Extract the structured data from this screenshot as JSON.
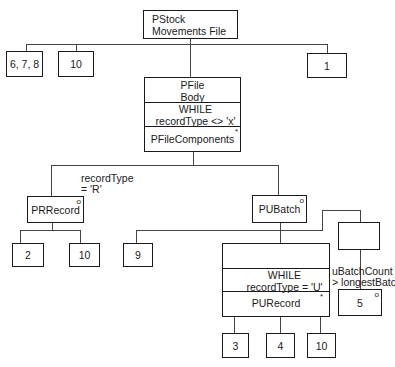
{
  "diagram": {
    "root": {
      "line1": "PStock",
      "line2": "Movements File"
    },
    "level1": [
      {
        "label": "6, 7, 8"
      },
      {
        "label": "10"
      },
      {
        "label": "1"
      }
    ],
    "file_body": {
      "title_line1": "PFile",
      "title_line2": "Body",
      "condition_line1": "WHILE",
      "condition_line2": "recordType <> 'x'",
      "components": "PFileComponents",
      "components_mark": "*"
    },
    "selection_condition": {
      "line1": "recordType",
      "line2": "= 'R'"
    },
    "prrecord": {
      "label": "PRRecord",
      "mark": "o"
    },
    "pubatch": {
      "label": "PUBatch",
      "mark": "o"
    },
    "prrecord_children": [
      {
        "label": "2"
      },
      {
        "label": "10"
      }
    ],
    "pubatch_first_child": {
      "label": "9"
    },
    "ubatch_loop": {
      "condition_line1": "WHILE",
      "condition_line2": "recordType = 'U'",
      "body": "PURecord",
      "body_mark": "*"
    },
    "optional_condition": {
      "line1": "uBatchCount",
      "line2": "> longestBatch"
    },
    "optional_child": {
      "label": "5",
      "mark": "o"
    },
    "purecord_children": [
      {
        "label": "3"
      },
      {
        "label": "4"
      },
      {
        "label": "10"
      }
    ]
  }
}
